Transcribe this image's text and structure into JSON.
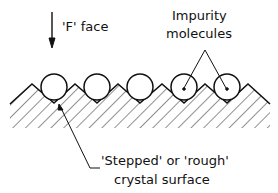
{
  "diagram": {
    "face_label": "'F' face",
    "impurity_label_line1": "Impurity",
    "impurity_label_line2": "molecules",
    "surface_label_line1": "'Stepped' or 'rough'",
    "surface_label_line2": "crystal surface"
  }
}
